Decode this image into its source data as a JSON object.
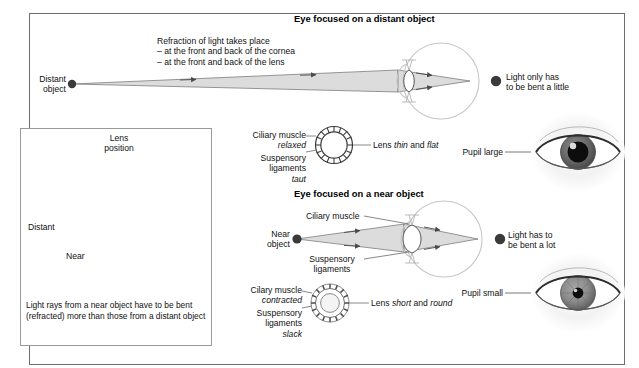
{
  "page": {
    "background": "#ffffff",
    "frame_border_color": "#6d6d6d"
  },
  "sections": {
    "distant": {
      "title": "Eye focused on a distant object",
      "note_lines": [
        "Refraction of light takes place",
        "– at the front and back of the cornea",
        "– at the front and back of the lens"
      ],
      "object_label_line1": "Distant",
      "object_label_line2": "object",
      "result_line1": "Light only has",
      "result_line2": "to be bent a little",
      "ciliary_label": "Ciliary muscle",
      "ciliary_state": "relaxed",
      "suspensory_label_line1": "Suspensory",
      "suspensory_label_line2": "ligaments",
      "suspensory_state": "taut",
      "lens_label_prefix": "Lens ",
      "lens_label_word1": "thin",
      "lens_label_join": " and ",
      "lens_label_word2": "flat",
      "pupil_label": "Pupil large"
    },
    "near": {
      "title": "Eye focused on a near object",
      "object_label_line1": "Near",
      "object_label_line2": "object",
      "result_line1": "Light has to",
      "result_line2": "be bent a lot",
      "ciliary_inline_label": "Ciliary muscle",
      "suspensory_inline_line1": "Suspensory",
      "suspensory_inline_line2": "ligaments",
      "ciliary_label": "Cilary muscle",
      "ciliary_state": "contracted",
      "suspensory_label_line1": "Suspensory",
      "suspensory_label_line2": "ligaments",
      "suspensory_state": "slack",
      "lens_label_prefix": "Lens ",
      "lens_label_word1": "short",
      "lens_label_join": " and ",
      "lens_label_word2": "round",
      "pupil_label": "Pupil small"
    }
  },
  "inset": {
    "title_line1": "Lens",
    "title_line2": "position",
    "distant_label": "Distant",
    "near_label": "Near",
    "caption": "Light rays from a near object have to be bent (refracted) more than those from a distant object"
  },
  "colors": {
    "ray_fill": "#d9d9d9",
    "ray_stroke": "#6a6a6a",
    "eye_outline": "#c9c9c9",
    "point_dark": "#3a3a3a",
    "text": "#111111",
    "inset_line": "#8c8c8c"
  }
}
